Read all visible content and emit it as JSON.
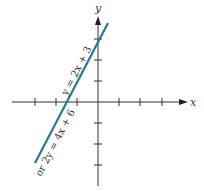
{
  "diagram": {
    "type": "coordinate-plane-line-graph",
    "axes": {
      "x_label": "x",
      "y_label": "y",
      "tick_spacing_units": 1,
      "x_ticks": [
        -3,
        -2,
        -1,
        1,
        2,
        3
      ],
      "y_ticks": [
        -3,
        -2,
        -1,
        1,
        2,
        3
      ]
    },
    "line": {
      "equation_primary": "y = 2x + 3",
      "equation_alternate": "or 2y = 4x + 6",
      "color": "#2a7a8c",
      "y_intercept": 3,
      "x_intercept": -1.5
    }
  }
}
